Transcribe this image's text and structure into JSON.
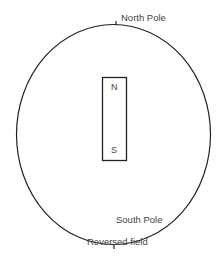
{
  "diagram": {
    "title": "Reversed field",
    "labels": {
      "north_pole": "North Pole",
      "south_pole": "South Pole"
    },
    "magnet": {
      "top_label": "N",
      "bottom_label": "S"
    },
    "colors": {
      "stroke": "#222222",
      "background": "#ffffff"
    }
  }
}
